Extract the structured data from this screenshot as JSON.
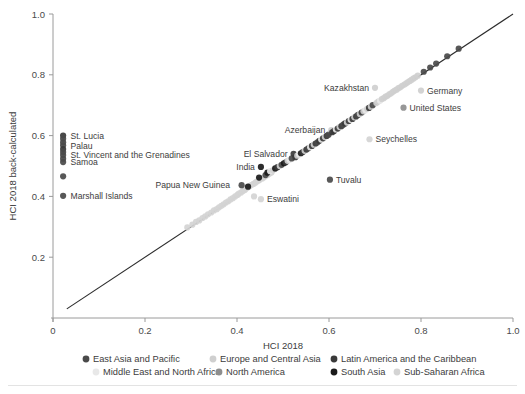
{
  "chart_data": {
    "type": "scatter",
    "title": "",
    "xlabel": "HCI 2018",
    "ylabel": "HCI 2018 back-calculated",
    "xlim": [
      0,
      1
    ],
    "ylim": [
      0,
      1
    ],
    "xticks": [
      "0",
      "0.2",
      "0.4",
      "0.6",
      "0.8",
      "1.0"
    ],
    "xtickvals": [
      0,
      0.2,
      0.4,
      0.6,
      0.8,
      1.0
    ],
    "yticks": [
      "0.2",
      "0.4",
      "0.6",
      "0.8",
      "1.0"
    ],
    "ytickvals": [
      0.2,
      0.4,
      0.6,
      0.8,
      1.0
    ],
    "grid": false,
    "reference_line": {
      "name": "identity-line",
      "from": [
        0.03,
        0.03
      ],
      "to": [
        1.0,
        1.0
      ]
    },
    "legend_position": "bottom",
    "series": [
      {
        "name": "East Asia and Pacific",
        "color": "#4a4a4a"
      },
      {
        "name": "Europe and Central Asia",
        "color": "#cfcfcf"
      },
      {
        "name": "Latin America and the Caribbean",
        "color": "#3a3a3a"
      },
      {
        "name": "Middle East and North Africa",
        "color": "#e8e8e8"
      },
      {
        "name": "North America",
        "color": "#8e8e8e"
      },
      {
        "name": "South Asia",
        "color": "#1a1a1a"
      },
      {
        "name": "Sub-Saharan Africa",
        "color": "#d4d4d4"
      }
    ],
    "annotations": [
      {
        "text": "St. Lucia",
        "x": 0.025,
        "y": 0.598,
        "anchor": "left"
      },
      {
        "text": "Palau",
        "x": 0.025,
        "y": 0.567,
        "anchor": "left"
      },
      {
        "text": "St. Vincent and the Grenadines",
        "x": 0.025,
        "y": 0.537,
        "anchor": "left"
      },
      {
        "text": "Samoa",
        "x": 0.025,
        "y": 0.513,
        "anchor": "left"
      },
      {
        "text": "Marshall Islands",
        "x": 0.025,
        "y": 0.402,
        "anchor": "left"
      },
      {
        "text": "Papua New Guinea",
        "x": 0.398,
        "y": 0.437,
        "anchor": "right"
      },
      {
        "text": "Eswatini",
        "x": 0.452,
        "y": 0.391,
        "anchor": "left"
      },
      {
        "text": "India",
        "x": 0.452,
        "y": 0.497,
        "anchor": "right"
      },
      {
        "text": "El Salvador",
        "x": 0.523,
        "y": 0.54,
        "anchor": "right"
      },
      {
        "text": "Tuvalu",
        "x": 0.602,
        "y": 0.455,
        "anchor": "left"
      },
      {
        "text": "Azerbaijan",
        "x": 0.605,
        "y": 0.618,
        "anchor": "right"
      },
      {
        "text": "Kazakhstan",
        "x": 0.7,
        "y": 0.757,
        "anchor": "right"
      },
      {
        "text": "Seychelles",
        "x": 0.688,
        "y": 0.588,
        "anchor": "left"
      },
      {
        "text": "United States",
        "x": 0.762,
        "y": 0.692,
        "anchor": "left"
      },
      {
        "text": "Germany",
        "x": 0.8,
        "y": 0.748,
        "anchor": "left"
      }
    ],
    "points": [
      {
        "x": 0.022,
        "y": 0.6,
        "s": "Latin America and the Caribbean"
      },
      {
        "x": 0.022,
        "y": 0.59,
        "s": "East Asia and Pacific"
      },
      {
        "x": 0.022,
        "y": 0.578,
        "s": "East Asia and Pacific"
      },
      {
        "x": 0.022,
        "y": 0.568,
        "s": "East Asia and Pacific"
      },
      {
        "x": 0.022,
        "y": 0.556,
        "s": "Latin America and the Caribbean"
      },
      {
        "x": 0.022,
        "y": 0.546,
        "s": "East Asia and Pacific"
      },
      {
        "x": 0.022,
        "y": 0.536,
        "s": "East Asia and Pacific"
      },
      {
        "x": 0.022,
        "y": 0.524,
        "s": "East Asia and Pacific"
      },
      {
        "x": 0.022,
        "y": 0.513,
        "s": "East Asia and Pacific"
      },
      {
        "x": 0.022,
        "y": 0.466,
        "s": "East Asia and Pacific"
      },
      {
        "x": 0.022,
        "y": 0.402,
        "s": "East Asia and Pacific"
      },
      {
        "x": 0.292,
        "y": 0.298,
        "s": "Sub-Saharan Africa"
      },
      {
        "x": 0.303,
        "y": 0.307,
        "s": "Sub-Saharan Africa"
      },
      {
        "x": 0.311,
        "y": 0.316,
        "s": "Sub-Saharan Africa"
      },
      {
        "x": 0.318,
        "y": 0.321,
        "s": "Sub-Saharan Africa"
      },
      {
        "x": 0.325,
        "y": 0.329,
        "s": "Sub-Saharan Africa"
      },
      {
        "x": 0.331,
        "y": 0.334,
        "s": "Sub-Saharan Africa"
      },
      {
        "x": 0.337,
        "y": 0.341,
        "s": "Sub-Saharan Africa"
      },
      {
        "x": 0.344,
        "y": 0.347,
        "s": "Sub-Saharan Africa"
      },
      {
        "x": 0.35,
        "y": 0.354,
        "s": "Sub-Saharan Africa"
      },
      {
        "x": 0.356,
        "y": 0.358,
        "s": "Sub-Saharan Africa"
      },
      {
        "x": 0.361,
        "y": 0.364,
        "s": "Sub-Saharan Africa"
      },
      {
        "x": 0.366,
        "y": 0.369,
        "s": "Sub-Saharan Africa"
      },
      {
        "x": 0.371,
        "y": 0.374,
        "s": "Sub-Saharan Africa"
      },
      {
        "x": 0.376,
        "y": 0.38,
        "s": "Sub-Saharan Africa"
      },
      {
        "x": 0.381,
        "y": 0.384,
        "s": "Sub-Saharan Africa"
      },
      {
        "x": 0.386,
        "y": 0.39,
        "s": "Sub-Saharan Africa"
      },
      {
        "x": 0.391,
        "y": 0.394,
        "s": "Sub-Saharan Africa"
      },
      {
        "x": 0.396,
        "y": 0.4,
        "s": "Sub-Saharan Africa"
      },
      {
        "x": 0.401,
        "y": 0.405,
        "s": "Sub-Saharan Africa"
      },
      {
        "x": 0.404,
        "y": 0.409,
        "s": "Sub-Saharan Africa"
      },
      {
        "x": 0.409,
        "y": 0.413,
        "s": "Sub-Saharan Africa"
      },
      {
        "x": 0.413,
        "y": 0.418,
        "s": "Sub-Saharan Africa"
      },
      {
        "x": 0.417,
        "y": 0.421,
        "s": "Sub-Saharan Africa"
      },
      {
        "x": 0.42,
        "y": 0.426,
        "s": "Sub-Saharan Africa"
      },
      {
        "x": 0.424,
        "y": 0.43,
        "s": "Sub-Saharan Africa"
      },
      {
        "x": 0.428,
        "y": 0.434,
        "s": "Sub-Saharan Africa"
      },
      {
        "x": 0.432,
        "y": 0.438,
        "s": "Sub-Saharan Africa"
      },
      {
        "x": 0.436,
        "y": 0.441,
        "s": "Sub-Saharan Africa"
      },
      {
        "x": 0.44,
        "y": 0.445,
        "s": "Sub-Saharan Africa"
      },
      {
        "x": 0.443,
        "y": 0.449,
        "s": "Sub-Saharan Africa"
      },
      {
        "x": 0.447,
        "y": 0.452,
        "s": "Sub-Saharan Africa"
      },
      {
        "x": 0.45,
        "y": 0.456,
        "s": "Sub-Saharan Africa"
      },
      {
        "x": 0.455,
        "y": 0.459,
        "s": "Sub-Saharan Africa"
      },
      {
        "x": 0.459,
        "y": 0.463,
        "s": "Sub-Saharan Africa"
      },
      {
        "x": 0.463,
        "y": 0.468,
        "s": "Sub-Saharan Africa"
      },
      {
        "x": 0.467,
        "y": 0.471,
        "s": "Sub-Saharan Africa"
      },
      {
        "x": 0.471,
        "y": 0.475,
        "s": "Sub-Saharan Africa"
      },
      {
        "x": 0.475,
        "y": 0.479,
        "s": "Sub-Saharan Africa"
      },
      {
        "x": 0.452,
        "y": 0.391,
        "s": "Sub-Saharan Africa"
      },
      {
        "x": 0.437,
        "y": 0.4,
        "s": "Sub-Saharan Africa"
      },
      {
        "x": 0.41,
        "y": 0.437,
        "s": "East Asia and Pacific"
      },
      {
        "x": 0.424,
        "y": 0.432,
        "s": "South Asia"
      },
      {
        "x": 0.448,
        "y": 0.462,
        "s": "South Asia"
      },
      {
        "x": 0.452,
        "y": 0.497,
        "s": "South Asia"
      },
      {
        "x": 0.462,
        "y": 0.47,
        "s": "East Asia and Pacific"
      },
      {
        "x": 0.466,
        "y": 0.478,
        "s": "South Asia"
      },
      {
        "x": 0.472,
        "y": 0.483,
        "s": "Middle East and North Africa"
      },
      {
        "x": 0.478,
        "y": 0.486,
        "s": "Sub-Saharan Africa"
      },
      {
        "x": 0.483,
        "y": 0.492,
        "s": "South Asia"
      },
      {
        "x": 0.488,
        "y": 0.496,
        "s": "Latin America and the Caribbean"
      },
      {
        "x": 0.493,
        "y": 0.5,
        "s": "Sub-Saharan Africa"
      },
      {
        "x": 0.497,
        "y": 0.504,
        "s": "East Asia and Pacific"
      },
      {
        "x": 0.502,
        "y": 0.509,
        "s": "South Asia"
      },
      {
        "x": 0.506,
        "y": 0.512,
        "s": "Latin America and the Caribbean"
      },
      {
        "x": 0.51,
        "y": 0.517,
        "s": "Sub-Saharan Africa"
      },
      {
        "x": 0.514,
        "y": 0.52,
        "s": "Middle East and North Africa"
      },
      {
        "x": 0.519,
        "y": 0.525,
        "s": "East Asia and Pacific"
      },
      {
        "x": 0.523,
        "y": 0.54,
        "s": "Latin America and the Caribbean"
      },
      {
        "x": 0.527,
        "y": 0.529,
        "s": "Latin America and the Caribbean"
      },
      {
        "x": 0.531,
        "y": 0.534,
        "s": "Europe and Central Asia"
      },
      {
        "x": 0.535,
        "y": 0.538,
        "s": "Middle East and North Africa"
      },
      {
        "x": 0.539,
        "y": 0.542,
        "s": "South Asia"
      },
      {
        "x": 0.543,
        "y": 0.546,
        "s": "Latin America and the Caribbean"
      },
      {
        "x": 0.547,
        "y": 0.55,
        "s": "Europe and Central Asia"
      },
      {
        "x": 0.551,
        "y": 0.554,
        "s": "Latin America and the Caribbean"
      },
      {
        "x": 0.555,
        "y": 0.558,
        "s": "East Asia and Pacific"
      },
      {
        "x": 0.559,
        "y": 0.562,
        "s": "Middle East and North Africa"
      },
      {
        "x": 0.563,
        "y": 0.566,
        "s": "Latin America and the Caribbean"
      },
      {
        "x": 0.567,
        "y": 0.57,
        "s": "Europe and Central Asia"
      },
      {
        "x": 0.571,
        "y": 0.574,
        "s": "Latin America and the Caribbean"
      },
      {
        "x": 0.575,
        "y": 0.578,
        "s": "East Asia and Pacific"
      },
      {
        "x": 0.579,
        "y": 0.583,
        "s": "Latin America and the Caribbean"
      },
      {
        "x": 0.583,
        "y": 0.587,
        "s": "Middle East and North Africa"
      },
      {
        "x": 0.587,
        "y": 0.591,
        "s": "Latin America and the Caribbean"
      },
      {
        "x": 0.591,
        "y": 0.595,
        "s": "Europe and Central Asia"
      },
      {
        "x": 0.595,
        "y": 0.599,
        "s": "Latin America and the Caribbean"
      },
      {
        "x": 0.599,
        "y": 0.603,
        "s": "East Asia and Pacific"
      },
      {
        "x": 0.602,
        "y": 0.455,
        "s": "East Asia and Pacific"
      },
      {
        "x": 0.605,
        "y": 0.618,
        "s": "Europe and Central Asia"
      },
      {
        "x": 0.607,
        "y": 0.611,
        "s": "Latin America and the Caribbean"
      },
      {
        "x": 0.611,
        "y": 0.615,
        "s": "Latin America and the Caribbean"
      },
      {
        "x": 0.615,
        "y": 0.62,
        "s": "Middle East and North Africa"
      },
      {
        "x": 0.619,
        "y": 0.623,
        "s": "Latin America and the Caribbean"
      },
      {
        "x": 0.623,
        "y": 0.628,
        "s": "Europe and Central Asia"
      },
      {
        "x": 0.627,
        "y": 0.631,
        "s": "Latin America and the Caribbean"
      },
      {
        "x": 0.631,
        "y": 0.636,
        "s": "East Asia and Pacific"
      },
      {
        "x": 0.635,
        "y": 0.64,
        "s": "Latin America and the Caribbean"
      },
      {
        "x": 0.639,
        "y": 0.643,
        "s": "Europe and Central Asia"
      },
      {
        "x": 0.643,
        "y": 0.648,
        "s": "Latin America and the Caribbean"
      },
      {
        "x": 0.647,
        "y": 0.652,
        "s": "Middle East and North Africa"
      },
      {
        "x": 0.651,
        "y": 0.655,
        "s": "Latin America and the Caribbean"
      },
      {
        "x": 0.655,
        "y": 0.66,
        "s": "Europe and Central Asia"
      },
      {
        "x": 0.659,
        "y": 0.663,
        "s": "Latin America and the Caribbean"
      },
      {
        "x": 0.663,
        "y": 0.668,
        "s": "East Asia and Pacific"
      },
      {
        "x": 0.688,
        "y": 0.588,
        "s": "Sub-Saharan Africa"
      },
      {
        "x": 0.667,
        "y": 0.671,
        "s": "Europe and Central Asia"
      },
      {
        "x": 0.671,
        "y": 0.676,
        "s": "Latin America and the Caribbean"
      },
      {
        "x": 0.675,
        "y": 0.68,
        "s": "Europe and Central Asia"
      },
      {
        "x": 0.679,
        "y": 0.683,
        "s": "Middle East and North Africa"
      },
      {
        "x": 0.683,
        "y": 0.688,
        "s": "Europe and Central Asia"
      },
      {
        "x": 0.687,
        "y": 0.691,
        "s": "Latin America and the Caribbean"
      },
      {
        "x": 0.691,
        "y": 0.695,
        "s": "Europe and Central Asia"
      },
      {
        "x": 0.695,
        "y": 0.7,
        "s": "East Asia and Pacific"
      },
      {
        "x": 0.7,
        "y": 0.757,
        "s": "Europe and Central Asia"
      },
      {
        "x": 0.703,
        "y": 0.707,
        "s": "Europe and Central Asia"
      },
      {
        "x": 0.707,
        "y": 0.712,
        "s": "Europe and Central Asia"
      },
      {
        "x": 0.711,
        "y": 0.715,
        "s": "Middle East and North Africa"
      },
      {
        "x": 0.715,
        "y": 0.72,
        "s": "Europe and Central Asia"
      },
      {
        "x": 0.719,
        "y": 0.723,
        "s": "Europe and Central Asia"
      },
      {
        "x": 0.723,
        "y": 0.728,
        "s": "Europe and Central Asia"
      },
      {
        "x": 0.727,
        "y": 0.731,
        "s": "Europe and Central Asia"
      },
      {
        "x": 0.731,
        "y": 0.736,
        "s": "Europe and Central Asia"
      },
      {
        "x": 0.735,
        "y": 0.739,
        "s": "Europe and Central Asia"
      },
      {
        "x": 0.739,
        "y": 0.744,
        "s": "Europe and Central Asia"
      },
      {
        "x": 0.743,
        "y": 0.748,
        "s": "Europe and Central Asia"
      },
      {
        "x": 0.747,
        "y": 0.751,
        "s": "Europe and Central Asia"
      },
      {
        "x": 0.751,
        "y": 0.756,
        "s": "Europe and Central Asia"
      },
      {
        "x": 0.755,
        "y": 0.759,
        "s": "Europe and Central Asia"
      },
      {
        "x": 0.762,
        "y": 0.692,
        "s": "North America"
      },
      {
        "x": 0.759,
        "y": 0.764,
        "s": "Europe and Central Asia"
      },
      {
        "x": 0.764,
        "y": 0.768,
        "s": "Europe and Central Asia"
      },
      {
        "x": 0.768,
        "y": 0.772,
        "s": "Europe and Central Asia"
      },
      {
        "x": 0.772,
        "y": 0.776,
        "s": "Europe and Central Asia"
      },
      {
        "x": 0.776,
        "y": 0.78,
        "s": "Europe and Central Asia"
      },
      {
        "x": 0.78,
        "y": 0.784,
        "s": "Europe and Central Asia"
      },
      {
        "x": 0.784,
        "y": 0.788,
        "s": "Europe and Central Asia"
      },
      {
        "x": 0.788,
        "y": 0.792,
        "s": "Europe and Central Asia"
      },
      {
        "x": 0.793,
        "y": 0.797,
        "s": "Europe and Central Asia"
      },
      {
        "x": 0.8,
        "y": 0.748,
        "s": "Europe and Central Asia"
      },
      {
        "x": 0.806,
        "y": 0.81,
        "s": "East Asia and Pacific"
      },
      {
        "x": 0.82,
        "y": 0.824,
        "s": "East Asia and Pacific"
      },
      {
        "x": 0.833,
        "y": 0.837,
        "s": "East Asia and Pacific"
      },
      {
        "x": 0.857,
        "y": 0.861,
        "s": "East Asia and Pacific"
      },
      {
        "x": 0.882,
        "y": 0.886,
        "s": "East Asia and Pacific"
      }
    ]
  }
}
